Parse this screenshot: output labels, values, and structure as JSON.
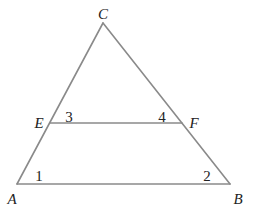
{
  "diagram": {
    "type": "triangle-with-parallel-segment",
    "stroke_color": "#8a8a8a",
    "text_color": "#222222",
    "vertices": {
      "A": {
        "label": "A",
        "x": 17,
        "y": 184
      },
      "B": {
        "label": "B",
        "x": 230,
        "y": 184
      },
      "C": {
        "label": "C",
        "x": 103,
        "y": 23
      },
      "E": {
        "label": "E",
        "x": 50,
        "y": 123
      },
      "F": {
        "label": "F",
        "x": 182,
        "y": 123
      }
    },
    "segments": [
      "AB",
      "BC",
      "CA",
      "EF"
    ],
    "point_labels": [
      {
        "id": "C",
        "text": "C",
        "x": 103,
        "y": 19
      },
      {
        "id": "E",
        "text": "E",
        "x": 39,
        "y": 128
      },
      {
        "id": "F",
        "text": "F",
        "x": 194,
        "y": 128
      },
      {
        "id": "A",
        "text": "A",
        "x": 12,
        "y": 204
      },
      {
        "id": "B",
        "text": "B",
        "x": 238,
        "y": 204
      }
    ],
    "angle_labels": [
      {
        "id": "angle-1",
        "text": "1",
        "x": 39,
        "y": 181
      },
      {
        "id": "angle-2",
        "text": "2",
        "x": 207,
        "y": 181
      },
      {
        "id": "angle-3",
        "text": "3",
        "x": 69,
        "y": 122
      },
      {
        "id": "angle-4",
        "text": "4",
        "x": 162,
        "y": 122
      }
    ]
  }
}
